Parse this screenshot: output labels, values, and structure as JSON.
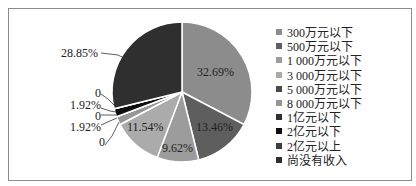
{
  "chart_data": {
    "type": "pie",
    "title": "",
    "categories": [
      "300万元以下",
      "500万元以下",
      "1 000万元以下",
      "3 000万元以下",
      "5 000万元以下",
      "8 000万元以下",
      "1亿元以下",
      "2亿元以下",
      "2亿元以上",
      "尚没有收入"
    ],
    "values": [
      32.69,
      13.46,
      9.62,
      11.54,
      0,
      1.92,
      0,
      1.92,
      0,
      28.85
    ],
    "value_labels": [
      "32.69%",
      "13.46%",
      "9.62%",
      "11.54%",
      "0",
      "1.92%",
      "0",
      "1.92%",
      "0",
      "28.85%"
    ],
    "colors": [
      "#8c8c8c",
      "#5e5e5e",
      "#9c9c9c",
      "#ababab",
      "#4a4a4a",
      "#969696",
      "#303030",
      "#0e0e0e",
      "#3c3c3c",
      "#2f2f2f"
    ],
    "legend_position": "right",
    "start_angle": "12 o'clock, clockwise"
  },
  "legend": {
    "items": [
      {
        "label": "300万元以下",
        "color": "#8c8c8c"
      },
      {
        "label": "500万元以下",
        "color": "#5e5e5e"
      },
      {
        "label": "1 000万元以下",
        "color": "#9c9c9c"
      },
      {
        "label": "3 000万元以下",
        "color": "#ababab"
      },
      {
        "label": "5 000万元以下",
        "color": "#4a4a4a"
      },
      {
        "label": "8 000万元以下",
        "color": "#969696"
      },
      {
        "label": "1亿元以下",
        "color": "#303030"
      },
      {
        "label": "2亿元以下",
        "color": "#0e0e0e"
      },
      {
        "label": "2亿元以上",
        "color": "#3c3c3c"
      },
      {
        "label": "尚没有收入",
        "color": "#2f2f2f"
      }
    ]
  },
  "labels": {
    "s0": "32.69%",
    "s1": "13.46%",
    "s2": "9.62%",
    "s3": "11.54%",
    "s4": "0",
    "s5": "1.92%",
    "s6": "0",
    "s7": "1.92%",
    "s8": "0",
    "s9": "28.85%"
  }
}
